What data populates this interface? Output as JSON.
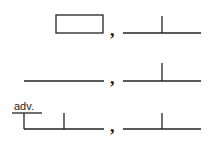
{
  "diagram": {
    "type": "sentence-diagram-patterns",
    "rows": [
      {
        "left": "box",
        "separator": ",",
        "right": "subject-verb baseline"
      },
      {
        "left": "baseline",
        "separator": ",",
        "right": "subject-verb baseline"
      },
      {
        "left": "subject-verb baseline with adverb modifier",
        "separator": ",",
        "right": "subject-verb baseline"
      }
    ],
    "labels": {
      "adverb": "adv.",
      "comma1": ",",
      "comma2": ",",
      "comma3": ","
    },
    "stroke_color": "#222222"
  }
}
